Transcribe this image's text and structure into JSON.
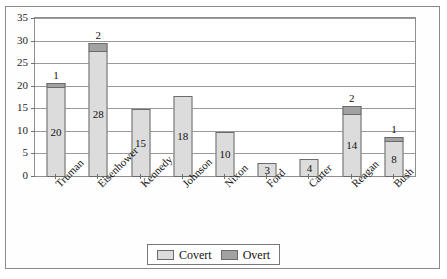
{
  "chart_data": {
    "type": "bar",
    "subtype": "stacked-vertical",
    "title": "",
    "xlabel": "",
    "ylabel": "",
    "ylim": [
      0,
      35
    ],
    "ytick_step": 5,
    "yticks": [
      35,
      30,
      25,
      20,
      15,
      10,
      5,
      0
    ],
    "grid": true,
    "legend_position": "bottom",
    "categories": [
      "Truman",
      "Eisenhower",
      "Kennedy",
      "Johnson",
      "Nixon",
      "Ford",
      "Carter",
      "Reagan",
      "Bush"
    ],
    "series": [
      {
        "name": "Covert",
        "color": "#dcdcdc",
        "values": [
          20,
          28,
          15,
          18,
          10,
          3,
          4,
          14,
          8
        ],
        "labels": [
          "20",
          "28",
          "15",
          "18",
          "10",
          "3",
          "4",
          "14",
          "8"
        ]
      },
      {
        "name": "Overt",
        "color": "#a2a2a2",
        "values": [
          1,
          2,
          0,
          0,
          0,
          0,
          0,
          2,
          1
        ],
        "labels": [
          "1",
          "2",
          "",
          "",
          "",
          "",
          "",
          "2",
          "1"
        ]
      }
    ],
    "totals": [
      21,
      30,
      15,
      18,
      10,
      3,
      4,
      16,
      9
    ]
  },
  "legend": {
    "items": [
      {
        "label": "Covert",
        "swatch": "covert"
      },
      {
        "label": "Overt",
        "swatch": "overt"
      }
    ]
  },
  "colors": {
    "covert": "#dcdcdc",
    "overt": "#a2a2a2",
    "gridline": "#9a9a9a",
    "axis": "#6f6f6f",
    "frame": "#8a8a8a",
    "text": "#111111"
  }
}
